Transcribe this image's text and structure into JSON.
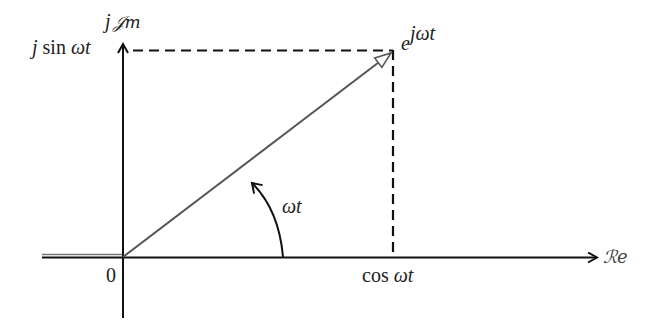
{
  "diagram": {
    "axes": {
      "imaginary_label_prefix": "j",
      "imaginary_label_symbol": "𝒥m",
      "real_label": "ℛe",
      "origin_label": "0"
    },
    "labels": {
      "sin_prefix": "j",
      "sin_func": "sin",
      "sin_arg": "ωt",
      "cos_func": "cos",
      "cos_arg": "ωt",
      "phasor_base": "e",
      "phasor_exp": "jωt",
      "angle": "ωt"
    },
    "colors": {
      "axis": "#111111",
      "vector": "#555555",
      "dashed": "#111111",
      "text": "#222222"
    }
  }
}
